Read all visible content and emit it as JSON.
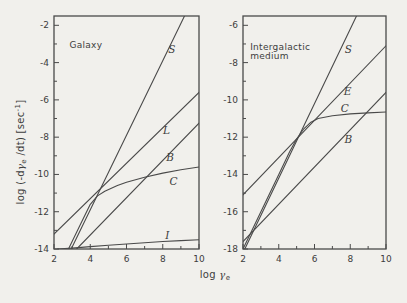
{
  "page": {
    "background": "#f1f0ec",
    "ink": "#3d3d3d",
    "line_color": "#4a4a4a"
  },
  "axis_labels": {
    "y_parts": {
      "prefix": "log (-d",
      "gamma": "γ",
      "gamma_sub": "e",
      "mid": " /dt)  [sec",
      "sup": "-1",
      "suffix": "]"
    },
    "x_parts": {
      "prefix": "log ",
      "gamma": "γ",
      "gamma_sub": "e"
    }
  },
  "chart_data": [
    {
      "id": "galaxy",
      "type": "line",
      "title": "Galaxy",
      "title_lines": [
        "Galaxy"
      ],
      "title_pos": [
        2.85,
        -3.2
      ],
      "xlabel": "log γe",
      "ylabel": "log (-dγe/dt) [sec⁻¹]",
      "xlim": [
        2,
        10
      ],
      "ylim": [
        -14,
        -1.5
      ],
      "xticks": [
        2,
        4,
        6,
        8,
        10
      ],
      "xticks_minor": [
        3,
        5,
        7,
        9
      ],
      "yticks": [
        -2,
        -4,
        -6,
        -8,
        -10,
        -12,
        -14
      ],
      "yticks_minor": [
        -3,
        -5,
        -7,
        -9,
        -11,
        -13
      ],
      "grid": false,
      "legend": "inline-curve-labels",
      "series": [
        {
          "name": "S",
          "label_pos": [
            8.5,
            -3.3
          ],
          "points": [
            [
              2.95,
              -14
            ],
            [
              9.2,
              -1.5
            ]
          ]
        },
        {
          "name": "L",
          "label_pos": [
            8.2,
            -7.65
          ],
          "points": [
            [
              2,
              -13.2
            ],
            [
              10,
              -5.6
            ]
          ]
        },
        {
          "name": "B",
          "label_pos": [
            8.4,
            -9.1
          ],
          "points": [
            [
              3.25,
              -14
            ],
            [
              10,
              -7.25
            ]
          ]
        },
        {
          "name": "C",
          "label_pos": [
            8.6,
            -10.4
          ],
          "points": [
            [
              2.8,
              -14
            ],
            [
              3.4,
              -12.8
            ],
            [
              4,
              -11.6
            ],
            [
              4.4,
              -11.15
            ],
            [
              4.8,
              -10.9
            ],
            [
              5.5,
              -10.6
            ],
            [
              6,
              -10.42
            ],
            [
              7,
              -10.15
            ],
            [
              8,
              -9.93
            ],
            [
              9,
              -9.75
            ],
            [
              10,
              -9.6
            ]
          ]
        },
        {
          "name": "I",
          "label_pos": [
            8.25,
            -13.3
          ],
          "points": [
            [
              2.2,
              -14
            ],
            [
              3,
              -13.95
            ],
            [
              4,
              -13.87
            ],
            [
              5,
              -13.8
            ],
            [
              6,
              -13.73
            ],
            [
              7,
              -13.66
            ],
            [
              8,
              -13.6
            ],
            [
              9,
              -13.55
            ],
            [
              10,
              -13.5
            ]
          ]
        }
      ]
    },
    {
      "id": "igm",
      "type": "line",
      "title": "Intergalactic medium",
      "title_lines": [
        "Intergalactic",
        "medium"
      ],
      "title_pos": [
        2.4,
        -7.3
      ],
      "xlabel": "log γe",
      "ylabel": "log (-dγe/dt) [sec⁻¹]",
      "xlim": [
        2,
        10
      ],
      "ylim": [
        -18,
        -5.5
      ],
      "xticks": [
        2,
        4,
        6,
        8,
        10
      ],
      "xticks_minor": [
        3,
        5,
        7,
        9
      ],
      "yticks": [
        -6,
        -8,
        -10,
        -12,
        -14,
        -16,
        -18
      ],
      "yticks_minor": [
        -7,
        -9,
        -11,
        -13,
        -15,
        -17
      ],
      "grid": false,
      "legend": "inline-curve-labels",
      "series": [
        {
          "name": "S",
          "label_pos": [
            7.9,
            -7.3
          ],
          "points": [
            [
              2.1,
              -18
            ],
            [
              8.35,
              -5.5
            ]
          ]
        },
        {
          "name": "E",
          "label_pos": [
            7.85,
            -9.55
          ],
          "points": [
            [
              2,
              -15.1
            ],
            [
              10,
              -7.1
            ]
          ]
        },
        {
          "name": "C",
          "label_pos": [
            7.7,
            -10.45
          ],
          "points": [
            [
              2,
              -18
            ],
            [
              3,
              -16
            ],
            [
              4,
              -14
            ],
            [
              4.6,
              -12.8
            ],
            [
              5,
              -12.1
            ],
            [
              5.4,
              -11.55
            ],
            [
              5.8,
              -11.2
            ],
            [
              6.2,
              -11.0
            ],
            [
              7,
              -10.85
            ],
            [
              8,
              -10.75
            ],
            [
              9,
              -10.7
            ],
            [
              10,
              -10.65
            ]
          ]
        },
        {
          "name": "B",
          "label_pos": [
            7.9,
            -12.1
          ],
          "points": [
            [
              2,
              -17.6
            ],
            [
              10,
              -9.6
            ]
          ]
        }
      ]
    }
  ]
}
